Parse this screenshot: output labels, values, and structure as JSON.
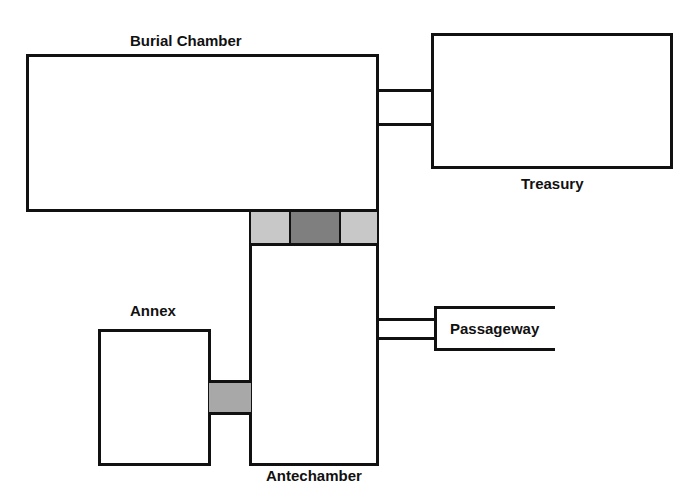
{
  "diagram": {
    "title": "",
    "rooms": [
      {
        "id": "burial-chamber",
        "label": "Burial Chamber"
      },
      {
        "id": "treasury",
        "label": "Treasury"
      },
      {
        "id": "antechamber",
        "label": "Antechamber"
      },
      {
        "id": "annex",
        "label": "Annex"
      },
      {
        "id": "passageway",
        "label": "Passageway"
      }
    ],
    "connections": [
      {
        "from": "burial-chamber",
        "to": "treasury",
        "type": "corridor"
      },
      {
        "from": "burial-chamber",
        "to": "antechamber",
        "type": "sealed-doorway",
        "segments": [
          "light",
          "dark",
          "light"
        ]
      },
      {
        "from": "antechamber",
        "to": "annex",
        "type": "shaded-doorway"
      },
      {
        "from": "antechamber",
        "to": "passageway",
        "type": "corridor"
      }
    ],
    "colors": {
      "line": "#111111",
      "background": "#ffffff",
      "light_shade": "#c8c8c8",
      "dark_shade": "#7f7f7f",
      "medium_shade": "#a8a8a8"
    }
  }
}
